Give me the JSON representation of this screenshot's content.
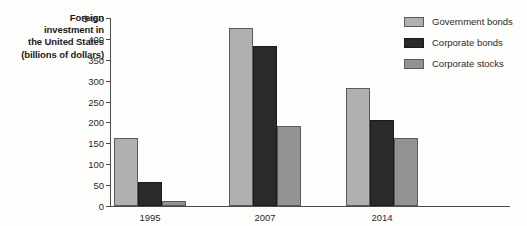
{
  "chart_data": {
    "type": "bar",
    "title": "",
    "xlabel": "",
    "ylabel": "Foreign investment in the United States (billions of dollars)",
    "ylabel_lines": [
      "Foreign",
      "investment in",
      "the United States",
      "(billions of dollars)"
    ],
    "categories": [
      "1995",
      "2007",
      "2014"
    ],
    "series": [
      {
        "name": "Government bonds",
        "color": "#b0b0b0",
        "values": [
          163,
          425,
          283
        ]
      },
      {
        "name": "Corporate bonds",
        "color": "#2a2a2a",
        "values": [
          57,
          382,
          207
        ]
      },
      {
        "name": "Corporate stocks",
        "color": "#929292",
        "values": [
          11,
          192,
          162
        ]
      }
    ],
    "ylim": [
      0,
      450
    ],
    "ytick_values": [
      0,
      50,
      100,
      150,
      200,
      250,
      300,
      350,
      400,
      450
    ],
    "ytick_labels": [
      "0",
      "50",
      "100",
      "150",
      "200",
      "250",
      "300",
      "350",
      "400",
      "$450"
    ],
    "grid": false,
    "legend_position": "top-right"
  }
}
